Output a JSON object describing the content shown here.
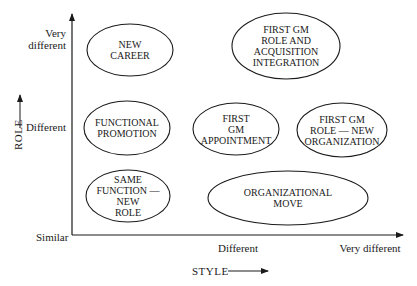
{
  "diagram": {
    "x_axis": {
      "title": "STYLE",
      "ticks": [
        {
          "label": "Similar",
          "x": 34,
          "y": 238
        },
        {
          "label": "Different",
          "x": 238,
          "y": 248
        },
        {
          "label": "Very different",
          "x": 370,
          "y": 248
        }
      ]
    },
    "y_axis": {
      "title": "ROLE",
      "ticks": [
        {
          "label": "Very different"
        },
        {
          "label": "Different"
        }
      ]
    },
    "colors": {
      "line": "#1a1a1a",
      "background": "#ffffff"
    },
    "nodes": [
      {
        "id": "new-career",
        "lines": [
          "NEW",
          "CAREER"
        ],
        "cx": 130,
        "cy": 50,
        "rx": 43,
        "ry": 26
      },
      {
        "id": "first-gm-acquisition",
        "lines": [
          "FIRST GM",
          "ROLE AND",
          "ACQUISITION",
          "INTEGRATION"
        ],
        "cx": 286,
        "cy": 46,
        "rx": 54,
        "ry": 33
      },
      {
        "id": "functional-promotion",
        "lines": [
          "FUNCTIONAL",
          "PROMOTION"
        ],
        "cx": 127,
        "cy": 128,
        "rx": 43,
        "ry": 27
      },
      {
        "id": "first-gm-appointment",
        "lines": [
          "FIRST",
          "GM",
          "APPOINTMENT"
        ],
        "cx": 236,
        "cy": 129,
        "rx": 43,
        "ry": 26
      },
      {
        "id": "first-gm-new-org",
        "lines": [
          "FIRST GM",
          "ROLE — NEW",
          "ORGANIZATION"
        ],
        "cx": 342,
        "cy": 130,
        "rx": 45,
        "ry": 27
      },
      {
        "id": "same-function-new-role",
        "lines": [
          "SAME",
          "FUNCTION —",
          "NEW",
          "ROLE"
        ],
        "cx": 128,
        "cy": 196,
        "rx": 42,
        "ry": 26
      },
      {
        "id": "organizational-move",
        "lines": [
          "ORGANIZATIONAL",
          "MOVE"
        ],
        "cx": 288,
        "cy": 198,
        "rx": 80,
        "ry": 27
      }
    ]
  }
}
